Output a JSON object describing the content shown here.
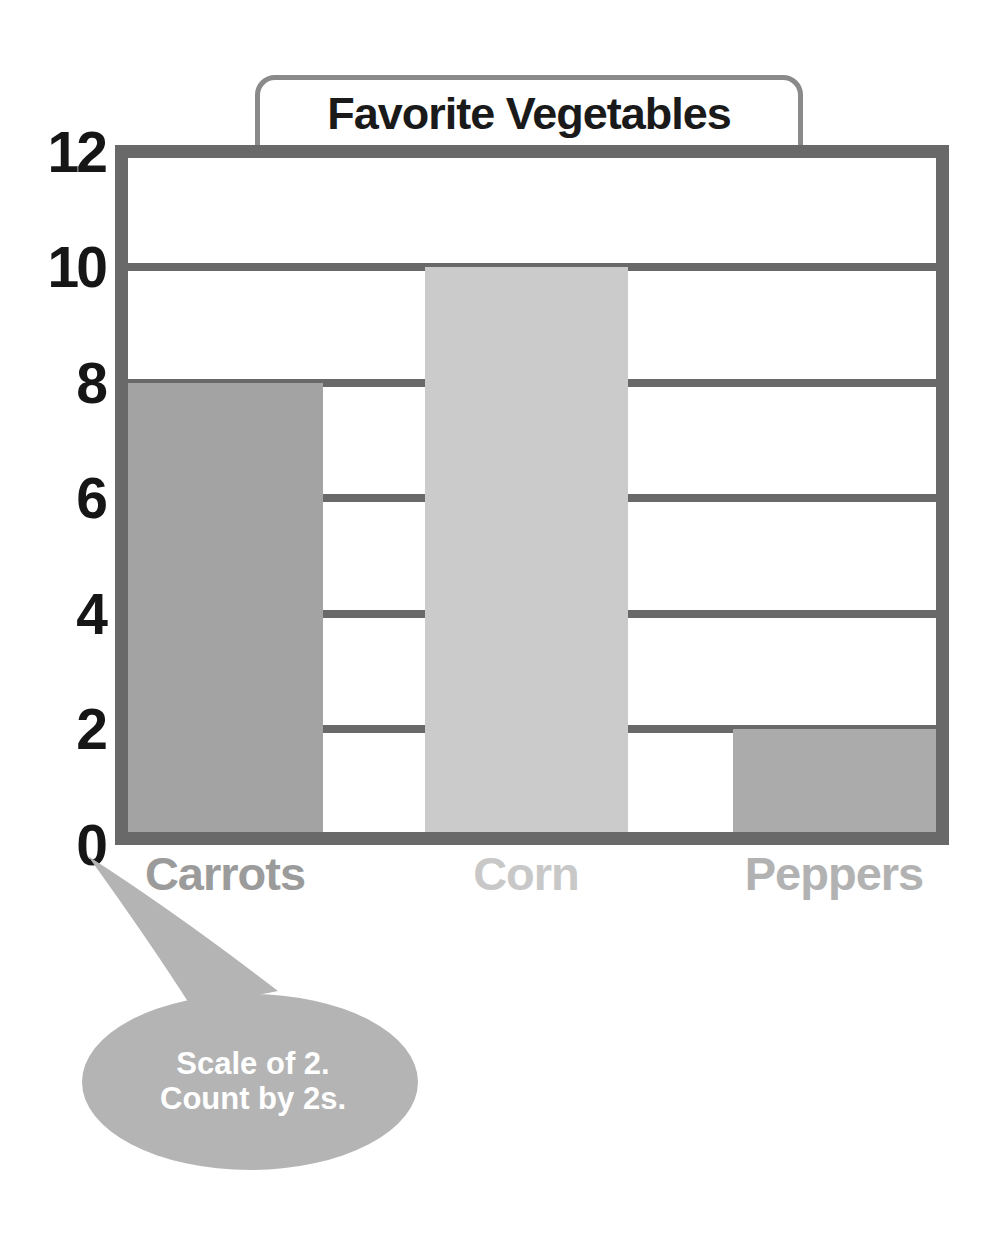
{
  "title": "Favorite Vegetables",
  "callout": {
    "line1": "Scale of 2.",
    "line2": "Count by 2s."
  },
  "chart_data": {
    "type": "bar",
    "title": "Favorite Vegetables",
    "categories": [
      "Carrots",
      "Corn",
      "Peppers"
    ],
    "values": [
      8,
      10,
      2
    ],
    "xlabel": "",
    "ylabel": "",
    "ylim": [
      0,
      12
    ],
    "yticks": [
      12,
      10,
      8,
      6,
      4,
      2,
      0
    ],
    "ytick_interval": 2,
    "grid": true,
    "legend": false,
    "annotation": "Scale of 2. Count by 2s.",
    "bar_colors": [
      "#a3a3a3",
      "#cbcbcb",
      "#ababab"
    ],
    "category_label_colors": [
      "#9b9b9b",
      "#c8c8c8",
      "#b2b2b2"
    ]
  },
  "colors": {
    "frame": "#696969",
    "gridline": "#696969",
    "title_border": "#8a8a8a",
    "axis_text": "#161616",
    "bubble_fill": "#b4b4b4",
    "bubble_text": "#ffffff",
    "background": "#ffffff"
  }
}
